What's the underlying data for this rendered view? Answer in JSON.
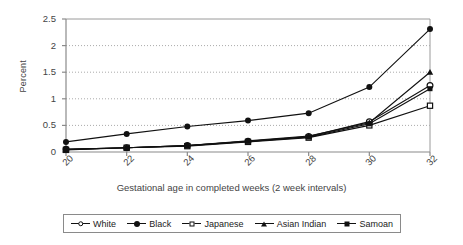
{
  "chart_data": {
    "type": "line",
    "title": "",
    "xlabel": "Gestational age in completed weeks (2 week intervals)",
    "ylabel": "Percent",
    "categories": [
      20,
      22,
      24,
      26,
      28,
      30,
      32
    ],
    "xticklabels": [
      "20",
      "22",
      "24",
      "26",
      "28",
      "30",
      "32"
    ],
    "yticklabels": [
      "0",
      "0.5",
      "1",
      "1.5",
      "2",
      "2.5"
    ],
    "ytickvalues": [
      0,
      0.5,
      1,
      1.5,
      2,
      2.5
    ],
    "ylim": [
      0,
      2.5
    ],
    "xlim": [
      20,
      32
    ],
    "grid": "horizontal-dotted",
    "legend_position": "bottom",
    "series": [
      {
        "name": "White",
        "marker": "open-circle",
        "values": [
          0.05,
          0.08,
          0.12,
          0.2,
          0.29,
          0.57,
          1.25
        ]
      },
      {
        "name": "Black",
        "marker": "filled-circle",
        "values": [
          0.19,
          0.34,
          0.48,
          0.59,
          0.73,
          1.22,
          2.31
        ]
      },
      {
        "name": "Japanese",
        "marker": "open-square",
        "values": [
          0.04,
          0.08,
          0.11,
          0.19,
          0.27,
          0.5,
          0.87
        ]
      },
      {
        "name": "Asian Indian",
        "marker": "filled-triangle",
        "values": [
          0.05,
          0.08,
          0.12,
          0.21,
          0.3,
          0.55,
          1.5
        ]
      },
      {
        "name": "Samoan",
        "marker": "filled-square",
        "values": [
          0.05,
          0.08,
          0.12,
          0.2,
          0.28,
          0.53,
          1.19
        ]
      }
    ]
  },
  "legend": {
    "items": [
      {
        "label": "White"
      },
      {
        "label": "Black"
      },
      {
        "label": "Japanese"
      },
      {
        "label": "Asian Indian"
      },
      {
        "label": "Samoan"
      }
    ]
  }
}
